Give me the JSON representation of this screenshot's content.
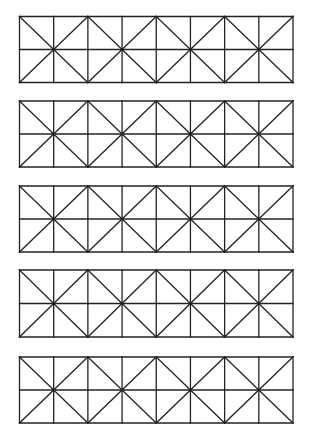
{
  "canvas": {
    "width": 314,
    "height": 444,
    "background": "#ffffff"
  },
  "style": {
    "stroke": "#222222",
    "stroke_width": 1.3
  },
  "grid": {
    "left": 19.5,
    "right": 293,
    "columns": 8,
    "rows": 2,
    "x_centers_column_indices": [
      1,
      3,
      5,
      7
    ]
  },
  "blocks": [
    {
      "id": 1,
      "top": 16.5,
      "bottom": 82.5
    },
    {
      "id": 2,
      "top": 101,
      "bottom": 167
    },
    {
      "id": 3,
      "top": 186,
      "bottom": 252
    },
    {
      "id": 4,
      "top": 270,
      "bottom": 337
    },
    {
      "id": 5,
      "top": 357,
      "bottom": 423
    }
  ]
}
